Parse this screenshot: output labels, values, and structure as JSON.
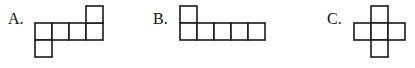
{
  "options": [
    {
      "label": "A.",
      "cell_size": 17,
      "cells": [
        [
          0,
          1
        ],
        [
          1,
          1
        ],
        [
          2,
          1
        ],
        [
          3,
          1
        ],
        [
          3,
          0
        ],
        [
          0,
          2
        ]
      ],
      "origin": [
        35,
        6
      ]
    },
    {
      "label": "B.",
      "cell_size": 17,
      "cells": [
        [
          0,
          0
        ],
        [
          0,
          1
        ],
        [
          1,
          1
        ],
        [
          2,
          1
        ],
        [
          3,
          1
        ],
        [
          4,
          1
        ]
      ],
      "origin": [
        180,
        6
      ]
    },
    {
      "label": "C.",
      "cell_size": 17,
      "cells": [
        [
          1,
          0
        ],
        [
          0,
          1
        ],
        [
          1,
          1
        ],
        [
          2,
          1
        ],
        [
          1,
          2
        ]
      ],
      "origin": [
        354,
        6
      ]
    }
  ],
  "colors": {
    "stroke": "#1a1a1a",
    "background": "#ffffff"
  }
}
